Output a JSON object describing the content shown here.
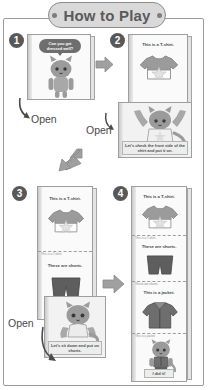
{
  "header": {
    "title": "How to Play",
    "left_dot": "dot",
    "right_dot": "dot"
  },
  "steps": [
    {
      "number": "1",
      "label": "step-1",
      "bubble_text": "Can you get dressed well?",
      "open_label": "Open"
    },
    {
      "number": "2",
      "label": "step-2",
      "top_caption": "This is a T-shirt.",
      "bottom_caption": "Let's check the front side of the shirt and put it on.",
      "open_label": "Open"
    },
    {
      "number": "3",
      "label": "step-3",
      "top_caption": "This is a T-shirt.",
      "mid_caption": "These are shorts.",
      "bottom_caption": "Let's sit down and put on shorts.",
      "open_label": "Open"
    },
    {
      "number": "4",
      "label": "step-4",
      "caption_1": "This is a T-shirt.",
      "caption_2": "These are shorts.",
      "caption_3": "This is a jacket.",
      "caption_4": "I did it!"
    }
  ],
  "arrows": {
    "step1_to_step2": "arrow-right",
    "step2_to_step3": "arrow-down-left",
    "step3_to_step4": "arrow-right",
    "open_curve_1": "arrow-curve-down",
    "open_curve_2": "arrow-curve-down",
    "open_curve_3": "arrow-curve-down"
  },
  "colors": {
    "frame": "#9a9a9a",
    "header_fill": "#d9d9d9",
    "header_border": "#8c8c8c",
    "text": "#4a4a4a",
    "step_badge": "#585858",
    "arrow": "#9d9d9d",
    "card_fill": "#f2f2f2",
    "bubble_fill": "#6e6e6e"
  }
}
